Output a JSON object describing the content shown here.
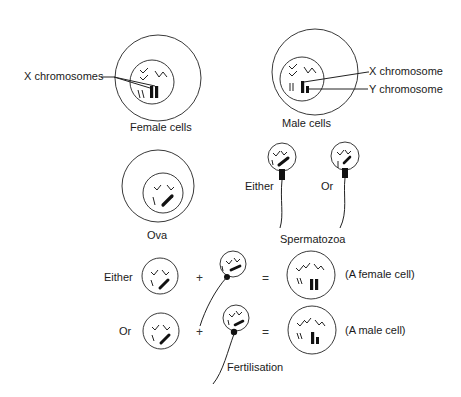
{
  "labels": {
    "x_chromosomes": "X chromosomes",
    "female_cells": "Female cells",
    "x_chromosome": "X chromosome",
    "y_chromosome": "Y chromosome",
    "male_cells": "Male cells",
    "ova": "Ova",
    "either_sperm": "Either",
    "or_sperm": "Or",
    "spermatozoa": "Spermatozoa",
    "fertilisation": "Fertilisation"
  },
  "rows": [
    {
      "prefix": "Either",
      "plus": "+",
      "equals": "=",
      "result": "(A female cell)"
    },
    {
      "prefix": "Or",
      "plus": "+",
      "equals": "=",
      "result": "(A male cell)"
    }
  ]
}
